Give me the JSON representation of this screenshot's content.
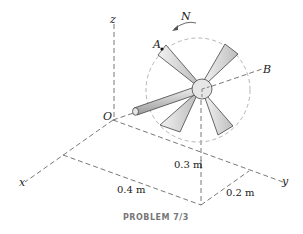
{
  "labels": {
    "z": "z",
    "x": "x",
    "y": "y",
    "O": "O",
    "A": "A",
    "B": "B",
    "N": "N"
  },
  "dimensions": {
    "d1": "0.3 m",
    "d2": "0.4 m",
    "d3": "0.2 m"
  },
  "caption": "PROBLEM 7/3",
  "colors": {
    "line": "#555555",
    "circle": "#b0b0b0",
    "blade": "#d8d8d8",
    "caption": "#777777"
  }
}
